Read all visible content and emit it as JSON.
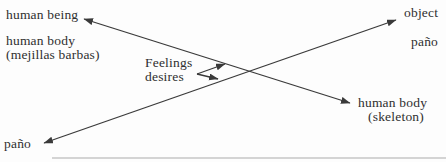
{
  "diagram": {
    "labels": {
      "human_being": "human being",
      "human_body_left_line1": "human body",
      "human_body_left_line2": "(mejillas barbas)",
      "feelings_line1": "Feelings",
      "feelings_line2": "desires",
      "object": "object",
      "pano_right": "paño",
      "human_body_right_line1": "human body",
      "human_body_right_line2": "(skeleton)",
      "pano_bottom": "paño"
    },
    "relations": [
      {
        "from": "human being",
        "to": "human body (skeleton)",
        "style": "double-headed-arrow"
      },
      {
        "from": "paño",
        "to": "object",
        "style": "double-headed-arrow"
      },
      {
        "from": "Feelings desires",
        "to": "upper crossing line",
        "style": "small-arrow"
      },
      {
        "from": "Feelings desires",
        "to": "lower crossing line",
        "style": "small-arrow"
      }
    ],
    "colors": {
      "text": "#2f2f2f",
      "line": "#3a3a3a",
      "rule": "#c6c6c6",
      "background": "#fdfdfd"
    }
  }
}
